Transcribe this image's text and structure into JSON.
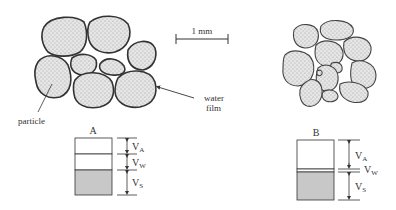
{
  "scale_bar": {
    "label": "1 mm"
  },
  "labels": {
    "particle": "particle",
    "water_film_line1": "water",
    "water_film_line2": "film"
  },
  "diagram_a": {
    "title": "A",
    "phases": [
      {
        "symbol": "V",
        "subscript": "A",
        "name": "air"
      },
      {
        "symbol": "V",
        "subscript": "W",
        "name": "water"
      },
      {
        "symbol": "V",
        "subscript": "S",
        "name": "solids"
      }
    ]
  },
  "diagram_b": {
    "title": "B",
    "phases": [
      {
        "symbol": "V",
        "subscript": "A",
        "name": "air"
      },
      {
        "symbol": "V",
        "subscript": "W",
        "name": "water"
      },
      {
        "symbol": "V",
        "subscript": "S",
        "name": "solids"
      }
    ]
  },
  "colors": {
    "outline": "#333333",
    "fill": "#dcdcdc",
    "solids": "#c8c8c8",
    "text": "#333333"
  }
}
